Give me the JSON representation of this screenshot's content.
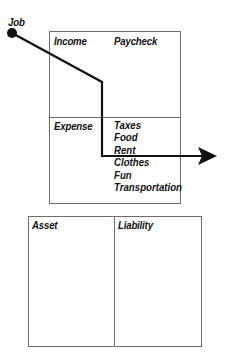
{
  "diagram": {
    "type": "cash-flow-diagram",
    "source_node": {
      "label": "Job"
    },
    "income_statement": {
      "income": {
        "label": "Income",
        "items": [
          "Paycheck"
        ]
      },
      "expense": {
        "label": "Expense",
        "items": [
          "Taxes",
          "Food",
          "Rent",
          "Clothes",
          "Fun",
          "Transportation"
        ]
      }
    },
    "balance_sheet": {
      "asset": {
        "label": "Asset",
        "items": []
      },
      "liability": {
        "label": "Liability",
        "items": []
      }
    },
    "flow": {
      "from": "Job",
      "through": [
        "Income",
        "Expense"
      ],
      "exits": "right",
      "line_color": "#111111",
      "box_border_color": "#6e6e6e"
    }
  }
}
